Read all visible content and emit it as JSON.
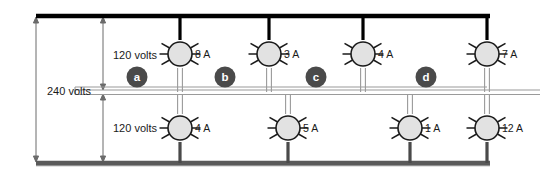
{
  "diagram": {
    "type": "electrical-schematic",
    "colors": {
      "hot_bus": "#000000",
      "neutral_bus": "#9a9a9a",
      "ground_bus": "#5a5a5a",
      "lamp_fill": "#e2e2e2",
      "lamp_stroke": "#1a1a1a",
      "letter_badge_fill": "#4a4a4a",
      "letter_text": "#ffffff",
      "text": "#1a1a1a",
      "dimension_line": "#6b6b6b"
    },
    "dimensions": [
      {
        "id": "overall",
        "label": "240 volts",
        "span": "line1-to-line2"
      },
      {
        "id": "upper",
        "label": "120 volts",
        "span": "line1-to-neutral"
      },
      {
        "id": "lower",
        "label": "120 volts",
        "span": "neutral-to-line2"
      }
    ],
    "sections": [
      {
        "id": "a",
        "label": "a"
      },
      {
        "id": "b",
        "label": "b"
      },
      {
        "id": "c",
        "label": "c"
      },
      {
        "id": "d",
        "label": "d"
      }
    ],
    "upper_loads": [
      {
        "id": "upper-1",
        "current": "8 A",
        "x": 180
      },
      {
        "id": "upper-2",
        "current": "3 A",
        "x": 269
      },
      {
        "id": "upper-3",
        "current": "4 A",
        "x": 363
      },
      {
        "id": "upper-4",
        "current": "7 A",
        "x": 487
      }
    ],
    "lower_loads": [
      {
        "id": "lower-1",
        "current": "4 A",
        "x": 180
      },
      {
        "id": "lower-2",
        "current": "5 A",
        "x": 288
      },
      {
        "id": "lower-3",
        "current": "1 A",
        "x": 410
      },
      {
        "id": "lower-4",
        "current": "12 A",
        "x": 487
      }
    ],
    "buses": [
      {
        "id": "line-1",
        "role": "hot-upper",
        "y": 16
      },
      {
        "id": "neutral",
        "role": "neutral-center",
        "y": 92
      },
      {
        "id": "line-2",
        "role": "hot-lower",
        "y": 163
      }
    ]
  }
}
